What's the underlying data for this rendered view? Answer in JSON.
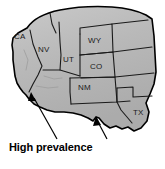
{
  "figure": {
    "type": "thematic-map",
    "region": "Western and Southwestern United States",
    "caption": "High prevalence",
    "colors": {
      "land_fill": "#b3b3b3",
      "land_fill_light": "#c6c6c6",
      "outline": "#000000",
      "state_border": "#1a1a1a",
      "background": "#ffffff",
      "label_text": "#1a1a1a",
      "caption_text": "#000000"
    },
    "states": [
      {
        "code": "CA",
        "name": "California",
        "x": 14,
        "y": 33
      },
      {
        "code": "NV",
        "name": "Nevada",
        "x": 38,
        "y": 46
      },
      {
        "code": "UT",
        "name": "Utah",
        "x": 63,
        "y": 56
      },
      {
        "code": "WY",
        "name": "Wyoming",
        "x": 88,
        "y": 37
      },
      {
        "code": "CO",
        "name": "Colorado",
        "x": 90,
        "y": 63
      },
      {
        "code": "NM",
        "name": "New Mexico",
        "x": 78,
        "y": 84
      },
      {
        "code": "TX",
        "name": "Texas",
        "x": 133,
        "y": 109
      }
    ],
    "annotations": [
      {
        "id": "arrow-left",
        "label": "High prevalence",
        "points_to": "Southern California / Arizona border region",
        "from_x": 57,
        "from_y": 140,
        "to_x": 32,
        "to_y": 95
      },
      {
        "id": "arrow-right",
        "label": "High prevalence",
        "points_to": "Southern Texas region",
        "from_x": 107,
        "from_y": 140,
        "to_x": 96,
        "to_y": 117
      }
    ]
  }
}
